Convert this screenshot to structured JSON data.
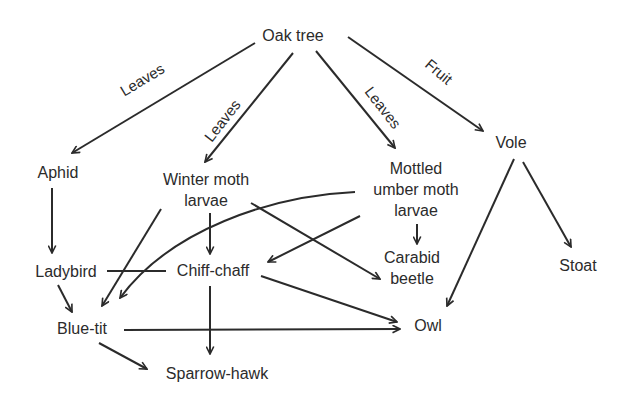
{
  "diagram": {
    "nodes": {
      "oak_tree": "Oak tree",
      "aphid": "Aphid",
      "winter_moth_1": "Winter moth",
      "winter_moth_2": "larvae",
      "mottled_1": "Mottled",
      "mottled_2": "umber moth",
      "mottled_3": "larvae",
      "vole": "Vole",
      "ladybird": "Ladybird",
      "chiff_chaff": "Chiff-chaff",
      "carabid_1": "Carabid",
      "carabid_2": "beetle",
      "stoat": "Stoat",
      "blue_tit": "Blue-tit",
      "owl": "Owl",
      "sparrow_hawk": "Sparrow-hawk"
    },
    "edge_labels": {
      "oak_aphid": "Leaves",
      "oak_winter": "Leaves",
      "oak_mottled": "Leaves",
      "oak_vole": "Fruit"
    },
    "edges": [
      {
        "from": "Oak tree",
        "to": "Aphid",
        "label": "Leaves"
      },
      {
        "from": "Oak tree",
        "to": "Winter moth larvae",
        "label": "Leaves"
      },
      {
        "from": "Oak tree",
        "to": "Mottled umber moth larvae",
        "label": "Leaves"
      },
      {
        "from": "Oak tree",
        "to": "Vole",
        "label": "Fruit"
      },
      {
        "from": "Aphid",
        "to": "Ladybird"
      },
      {
        "from": "Winter moth larvae",
        "to": "Chiff-chaff"
      },
      {
        "from": "Winter moth larvae",
        "to": "Blue-tit"
      },
      {
        "from": "Winter moth larvae",
        "to": "Carabid beetle"
      },
      {
        "from": "Mottled umber moth larvae",
        "to": "Carabid beetle"
      },
      {
        "from": "Mottled umber moth larvae",
        "to": "Chiff-chaff"
      },
      {
        "from": "Mottled umber moth larvae",
        "to": "Blue-tit"
      },
      {
        "from": "Vole",
        "to": "Owl"
      },
      {
        "from": "Vole",
        "to": "Stoat"
      },
      {
        "from": "Ladybird",
        "to": "Blue-tit"
      },
      {
        "from": "Ladybird",
        "to": "Chiff-chaff"
      },
      {
        "from": "Chiff-chaff",
        "to": "Sparrow-hawk"
      },
      {
        "from": "Chiff-chaff",
        "to": "Owl"
      },
      {
        "from": "Blue-tit",
        "to": "Owl"
      },
      {
        "from": "Blue-tit",
        "to": "Sparrow-hawk"
      }
    ]
  }
}
